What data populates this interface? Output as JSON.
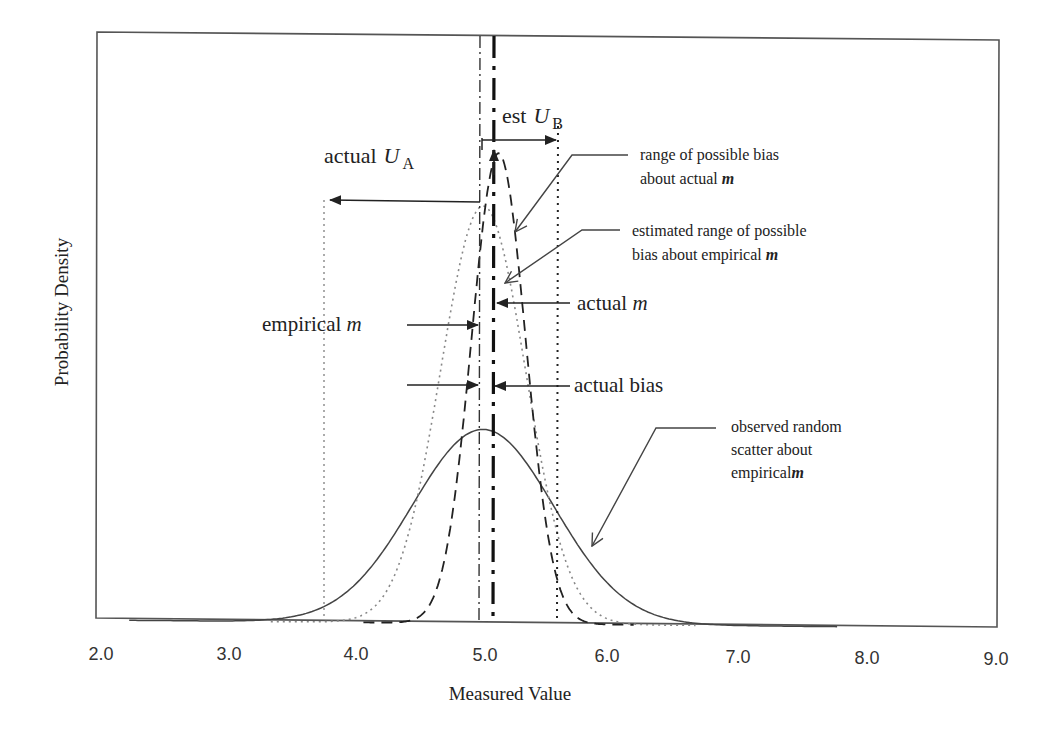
{
  "chart_data": {
    "type": "line",
    "title": "",
    "xlabel": "Measured Value",
    "ylabel": "Probability Density",
    "xlim": [
      2.0,
      9.0
    ],
    "xticks": [
      "2.0",
      "3.0",
      "4.0",
      "5.0",
      "6.0",
      "7.0",
      "8.0",
      "9.0"
    ],
    "yticks": [],
    "grid": false,
    "legend": null,
    "series": [
      {
        "name": "observed random scatter about empirical m",
        "style": "solid",
        "mean": 5.0,
        "sd": 0.55,
        "relative_peak": 0.33
      },
      {
        "name": "estimated range of possible bias about empirical m",
        "style": "dotted-grey",
        "mean": 5.0,
        "sd": 0.33,
        "relative_peak": 0.71
      },
      {
        "name": "range of possible bias about actual m",
        "style": "dashed",
        "mean": 5.12,
        "sd": 0.21,
        "relative_peak": 0.8
      }
    ],
    "vertical_lines": [
      {
        "name": "actual U_A bound",
        "x": 3.8,
        "style": "dotted-grey"
      },
      {
        "name": "empirical m",
        "x": 5.0,
        "style": "dash-dot-thin"
      },
      {
        "name": "actual m",
        "x": 5.12,
        "style": "dash-dot-bold"
      },
      {
        "name": "est U_B bound",
        "x": 5.62,
        "style": "dotted"
      }
    ]
  },
  "axes": {
    "xlabel": "Measured Value",
    "ylabel": "Probability Density",
    "xticks": [
      "2.0",
      "3.0",
      "4.0",
      "5.0",
      "6.0",
      "7.0",
      "8.0",
      "9.0"
    ]
  },
  "annotations": {
    "est_ub": {
      "prefix": "est",
      "symbol": "U",
      "sub": "B"
    },
    "actual_ua": {
      "prefix": "actual",
      "symbol": "U",
      "sub": "A"
    },
    "range_actual": {
      "line1": "range of possible bias",
      "line2": "about actual",
      "m": "m"
    },
    "range_empirical": {
      "line1": "estimated range of possible",
      "line2": "bias about empirical",
      "m": "m"
    },
    "actual_m": {
      "text": "actual",
      "m": "m"
    },
    "empirical_m": {
      "text": "empirical",
      "m": "m"
    },
    "actual_bias": {
      "text": "actual bias"
    },
    "observed": {
      "line1": "observed random",
      "line2": "scatter about",
      "line3": "empirical",
      "m": "m"
    }
  }
}
